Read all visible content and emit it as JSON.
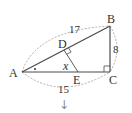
{
  "diagram": {
    "type": "right-triangle-geometry",
    "colors": {
      "line": "#4a4a4a",
      "dashed": "#9a9a9a",
      "text": "#333333",
      "arrow": "#8a8a8a"
    },
    "points": {
      "A": {
        "label": "A",
        "x": 22,
        "y": 72
      },
      "B": {
        "label": "B",
        "x": 110,
        "y": 26
      },
      "C": {
        "label": "C",
        "x": 110,
        "y": 72
      },
      "D": {
        "label": "D",
        "x": 64,
        "y": 50
      },
      "E": {
        "label": "E",
        "x": 78,
        "y": 72
      }
    },
    "lengths": {
      "AB": "17",
      "BC": "8",
      "AC": "15"
    },
    "angle_label": "x",
    "right_angles": [
      "C",
      "D"
    ],
    "angle_mark_at": "A",
    "arrow": "↓"
  }
}
